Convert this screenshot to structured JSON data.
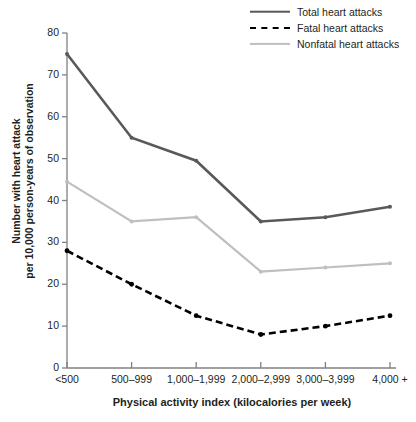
{
  "chart_data": {
    "type": "line",
    "title": "",
    "xlabel": "Physical activity index (kilocalories per week)",
    "ylabel": "Number with heart attack\nper 10,000 person-years of observation",
    "ylabel_line1": "Number with heart attack",
    "ylabel_line2": "per 10,000 person-years of observation",
    "categories": [
      "<500",
      "500–999",
      "1,000–1,999",
      "2,000–2,999",
      "3,000–3,999",
      "4,000 +"
    ],
    "ylim": [
      0,
      80
    ],
    "yticks": [
      0,
      10,
      20,
      30,
      40,
      50,
      60,
      70,
      80
    ],
    "grid": false,
    "legend_position": "top-right",
    "series": [
      {
        "name": "Total heart attacks",
        "values": [
          75,
          55,
          49.5,
          35,
          36,
          38.5
        ],
        "color": "#595959",
        "style": "solid",
        "width": 2.6,
        "marker": true
      },
      {
        "name": "Fatal heart attacks",
        "values": [
          28,
          20,
          12.5,
          8,
          10,
          12.5
        ],
        "color": "#000000",
        "style": "dashed",
        "width": 2.6,
        "marker": true
      },
      {
        "name": "Nonfatal heart attacks",
        "values": [
          44.5,
          35,
          36,
          23,
          24,
          25
        ],
        "color": "#bfbfbf",
        "style": "solid",
        "width": 2.2,
        "marker": true
      }
    ]
  },
  "legend": {
    "items": [
      {
        "label": "Total heart attacks"
      },
      {
        "label": "Fatal heart attacks"
      },
      {
        "label": "Nonfatal heart attacks"
      }
    ]
  },
  "axes": {
    "y_tick_labels": [
      "80",
      "70",
      "60",
      "50",
      "40",
      "30",
      "20",
      "10",
      "0"
    ],
    "x_tick_labels": [
      "<500",
      "500–999",
      "1,000–1,999",
      "2,000–2,999",
      "3,000–3,999",
      "4,000 +"
    ]
  }
}
